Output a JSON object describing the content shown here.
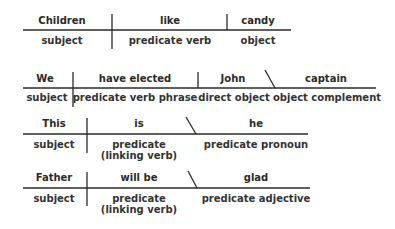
{
  "colors": {
    "ink": "#2a2a2a",
    "background": "#ffffff"
  },
  "diagrams": [
    {
      "sentence": "Children like candy",
      "words": [
        "Children",
        "like",
        "candy"
      ],
      "labels": [
        "subject",
        "predicate verb",
        "object"
      ]
    },
    {
      "sentence": "We have elected John captain",
      "words": [
        "We",
        "have elected",
        "John",
        "captain"
      ],
      "labels": [
        "subject",
        "predicate verb phrase",
        "direct object",
        "object complement"
      ]
    },
    {
      "sentence": "This is he",
      "words": [
        "This",
        "is",
        "he"
      ],
      "labels": [
        "subject",
        "predicate",
        "predicate pronoun"
      ],
      "label_notes": [
        "",
        "(linking verb)",
        ""
      ]
    },
    {
      "sentence": "Father will be glad",
      "words": [
        "Father",
        "will be",
        "glad"
      ],
      "labels": [
        "subject",
        "predicate",
        "predicate adjective"
      ],
      "label_notes": [
        "",
        "(linking verb)",
        ""
      ]
    }
  ]
}
